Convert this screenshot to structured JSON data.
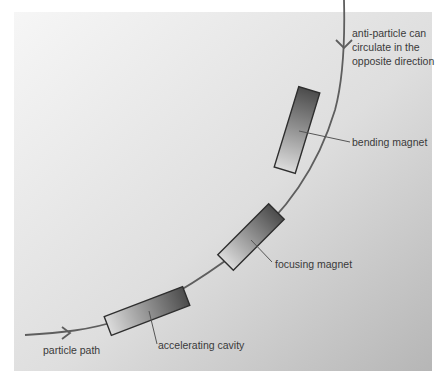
{
  "diagram": {
    "type": "particle-accelerator-ring-segment",
    "labels": {
      "particle_path": "particle path",
      "accelerating_cavity": "accelerating cavity",
      "focusing_magnet": "focusing magnet",
      "bending_magnet": "bending magnet",
      "anti_particle": [
        "anti-particle can",
        "circulate in the",
        "opposite direction"
      ]
    },
    "components": [
      {
        "name": "accelerating cavity",
        "type": "cavity"
      },
      {
        "name": "focusing magnet",
        "type": "magnet"
      },
      {
        "name": "bending magnet",
        "type": "magnet"
      }
    ],
    "arrows": [
      {
        "name": "particle direction",
        "direction": "right"
      },
      {
        "name": "anti-particle direction",
        "direction": "down"
      }
    ],
    "colors": {
      "background_light": "#f4f4f4",
      "background_dark": "#b9b9b9",
      "path": "#5e5e5e",
      "component_dark": "#4a4a4a",
      "component_light": "#d6d6d6",
      "text": "#3a3a3a"
    }
  }
}
